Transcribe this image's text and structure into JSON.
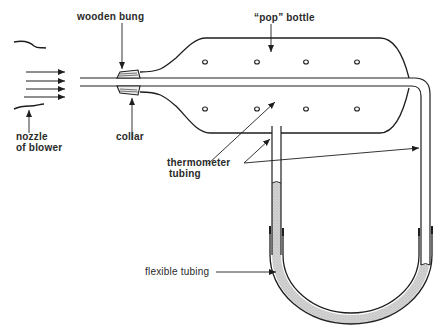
{
  "diagram": {
    "title": "",
    "labels": {
      "wooden_bung": "wooden bung",
      "pop_bottle": "“pop” bottle",
      "nozzle_line1": "nozzle",
      "nozzle_line2": "of blower",
      "collar": "collar",
      "thermometer_line1": "thermometer",
      "thermometer_line2": "tubing",
      "flexible_tubing": "flexible tubing"
    },
    "components": [
      "nozzle of blower",
      "air flow arrows",
      "wooden bung",
      "collar",
      "pop bottle",
      "thermometer tubing (horizontal through bottle)",
      "thermometer tubing (vertical from bottle)",
      "flexible tubing (U-tube manometer)",
      "manometer liquid"
    ],
    "colors": {
      "line": "#1e1e1e",
      "liquid": "#cfcfcf",
      "background": "#ffffff"
    }
  }
}
